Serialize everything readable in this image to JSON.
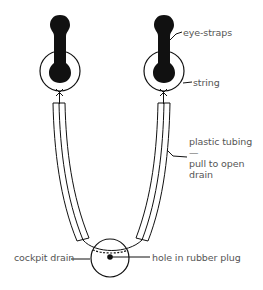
{
  "diagram": {
    "labels": {
      "eye_straps": "eye-straps",
      "string": "string",
      "tubing_line1": "plastic tubing—",
      "tubing_line2": "pull to open",
      "tubing_line3": "drain",
      "cockpit_drain": "cockpit drain",
      "hole": "hole in rubber plug"
    },
    "colors": {
      "ink": "#111111",
      "label_text": "#555555",
      "background": "#ffffff"
    }
  }
}
